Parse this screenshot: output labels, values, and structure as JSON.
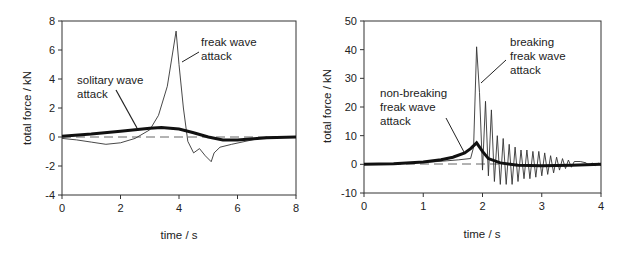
{
  "chart_data": [
    {
      "type": "line",
      "title": "",
      "xlabel": "time / s",
      "ylabel": "total force / kN",
      "xlim": [
        0,
        8
      ],
      "ylim": [
        -4,
        8
      ],
      "x_ticks": [
        "0",
        "2",
        "4",
        "6",
        "8"
      ],
      "y_ticks": [
        "8",
        "6",
        "4",
        "2",
        "0",
        "-2",
        "-4"
      ],
      "grid": false,
      "legend": "none (inline annotations)",
      "annotations": [
        {
          "text": [
            "freak wave",
            "attack"
          ],
          "points_to_series": "freak wave attack"
        },
        {
          "text": [
            "solitary wave",
            "attack"
          ],
          "points_to_series": "solitary wave attack"
        }
      ],
      "reference_line": {
        "style": "dashed",
        "y": 0
      },
      "series": [
        {
          "name": "freak wave attack",
          "style": "thin",
          "x": [
            0,
            0.5,
            1.0,
            1.5,
            2.0,
            2.5,
            3.0,
            3.3,
            3.6,
            3.8,
            3.9,
            4.0,
            4.15,
            4.3,
            4.5,
            4.7,
            4.9,
            5.1,
            5.2,
            5.4,
            5.8,
            6.5,
            7.0,
            8.0
          ],
          "y": [
            -0.1,
            -0.2,
            -0.35,
            -0.5,
            -0.4,
            -0.1,
            0.5,
            1.5,
            3.5,
            6.0,
            7.3,
            5.0,
            2.0,
            -0.3,
            -1.1,
            -0.8,
            -1.3,
            -1.7,
            -1.1,
            -0.7,
            -0.5,
            -0.2,
            0.0,
            0.0
          ]
        },
        {
          "name": "solitary wave attack",
          "style": "thick",
          "x": [
            0,
            1,
            2,
            3,
            3.4,
            4,
            4.5,
            5,
            5.5,
            6,
            7,
            8
          ],
          "y": [
            0.05,
            0.2,
            0.4,
            0.6,
            0.65,
            0.55,
            0.3,
            0.0,
            -0.2,
            -0.2,
            -0.05,
            0.0
          ]
        }
      ]
    },
    {
      "type": "line",
      "title": "",
      "xlabel": "time / s",
      "ylabel": "total force / kN",
      "xlim": [
        0,
        4
      ],
      "ylim": [
        -10,
        50
      ],
      "x_ticks": [
        "0",
        "1",
        "2",
        "3",
        "4"
      ],
      "y_ticks": [
        "50",
        "40",
        "30",
        "20",
        "10",
        "0",
        "-10"
      ],
      "grid": false,
      "legend": "none (inline annotations)",
      "annotations": [
        {
          "text": [
            "breaking",
            "freak wave",
            "attack"
          ],
          "points_to_series": "breaking freak wave attack"
        },
        {
          "text": [
            "non-breaking",
            "freak wave",
            "attack"
          ],
          "points_to_series": "non-breaking freak wave attack"
        }
      ],
      "reference_line": {
        "style": "dashed",
        "y": 0
      },
      "series": [
        {
          "name": "breaking freak wave attack",
          "style": "thin oscillating",
          "peak": {
            "x": 1.9,
            "y": 41
          },
          "oscillation_peaks": [
            {
              "x": 1.95,
              "y": 25
            },
            {
              "x": 2.05,
              "y": 22
            },
            {
              "x": 2.15,
              "y": 19
            },
            {
              "x": 2.25,
              "y": 10
            },
            {
              "x": 2.35,
              "y": 9
            },
            {
              "x": 2.45,
              "y": 7
            },
            {
              "x": 2.55,
              "y": 6
            },
            {
              "x": 2.65,
              "y": 5
            },
            {
              "x": 2.75,
              "y": 5
            },
            {
              "x": 2.85,
              "y": 4.5
            },
            {
              "x": 2.95,
              "y": 4.5
            },
            {
              "x": 3.05,
              "y": 4
            },
            {
              "x": 3.15,
              "y": 3
            },
            {
              "x": 3.25,
              "y": 2.5
            },
            {
              "x": 3.35,
              "y": 2
            },
            {
              "x": 3.45,
              "y": 1.5
            },
            {
              "x": 3.55,
              "y": 1
            },
            {
              "x": 3.65,
              "y": 1
            },
            {
              "x": 3.75,
              "y": 0.5
            }
          ],
          "oscillation_troughs": [
            {
              "x": 2.0,
              "y": -2
            },
            {
              "x": 2.1,
              "y": -4
            },
            {
              "x": 2.2,
              "y": -6
            },
            {
              "x": 2.3,
              "y": -7
            },
            {
              "x": 2.4,
              "y": -7
            },
            {
              "x": 2.5,
              "y": -7
            },
            {
              "x": 2.6,
              "y": -6
            },
            {
              "x": 2.7,
              "y": -5
            },
            {
              "x": 2.8,
              "y": -5
            },
            {
              "x": 2.9,
              "y": -4.5
            },
            {
              "x": 3.0,
              "y": -4
            },
            {
              "x": 3.1,
              "y": -3.5
            },
            {
              "x": 3.2,
              "y": -3
            },
            {
              "x": 3.3,
              "y": -2
            },
            {
              "x": 3.4,
              "y": -1.5
            },
            {
              "x": 3.5,
              "y": -1
            }
          ]
        },
        {
          "name": "non-breaking freak wave attack",
          "style": "thick",
          "x": [
            0,
            0.5,
            1.0,
            1.3,
            1.5,
            1.7,
            1.8,
            1.9,
            2.0,
            2.1,
            2.3,
            2.6,
            3.0,
            3.5,
            4.0
          ],
          "y": [
            0,
            0.2,
            0.8,
            1.6,
            2.5,
            4.0,
            5.5,
            7.5,
            4.5,
            2.0,
            0.5,
            -0.3,
            -0.5,
            -0.3,
            0.0
          ]
        }
      ]
    }
  ]
}
